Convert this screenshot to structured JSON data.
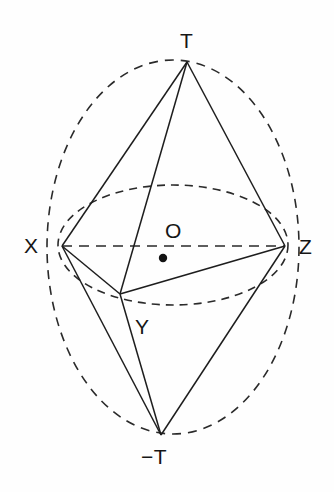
{
  "figure": {
    "canvas": {
      "width": 334,
      "height": 492
    },
    "background_color": "#fefefe",
    "stroke_color": "#1d1d1d",
    "dash_color": "#2a2a2a"
  },
  "labels": {
    "apex_top": "T",
    "apex_bottom": "−T",
    "left": "X",
    "right": "Z",
    "front": "Y",
    "center": "O"
  },
  "points": {
    "T": {
      "name": "T",
      "x": 187,
      "y": 62,
      "label_x": 180,
      "label_y": 30
    },
    "X": {
      "name": "X",
      "x": 62,
      "y": 246,
      "label_x": 24,
      "label_y": 235
    },
    "Z": {
      "name": "Z",
      "x": 285,
      "y": 246,
      "label_x": 299,
      "label_y": 236
    },
    "Y": {
      "name": "Y",
      "x": 120,
      "y": 294,
      "label_x": 135,
      "label_y": 316
    },
    "NT": {
      "name": "-T",
      "x": 161,
      "y": 435,
      "label_x": 141,
      "label_y": 446
    },
    "O": {
      "name": "O",
      "x": 163,
      "y": 258,
      "label_x": 165,
      "label_y": 220
    }
  },
  "center_dot": {
    "x": 163,
    "y": 258,
    "r": 4.2
  },
  "outer_ellipse": {
    "cx": 173,
    "cy": 247,
    "rx": 126,
    "ry": 187,
    "style": "dashed"
  },
  "inner_ellipse": {
    "cx": 173,
    "cy": 245,
    "rx": 115,
    "ry": 60,
    "style": "dashed"
  },
  "solid_edges": [
    {
      "id": "T-X",
      "from": "T",
      "to": "X"
    },
    {
      "id": "T-Y",
      "from": "T",
      "to": "Y"
    },
    {
      "id": "T-Z",
      "from": "T",
      "to": "Z"
    },
    {
      "id": "X-Y",
      "from": "X",
      "to": "Y"
    },
    {
      "id": "Y-Z",
      "from": "Y",
      "to": "Z"
    },
    {
      "id": "X-NT",
      "from": "X",
      "to": "NT"
    },
    {
      "id": "Y-NT",
      "from": "Y",
      "to": "NT"
    },
    {
      "id": "Z-NT",
      "from": "Z",
      "to": "NT"
    }
  ],
  "dashed_edges": [
    {
      "id": "X-Z",
      "from": "X",
      "to": "Z"
    }
  ],
  "stroke_widths": {
    "edge": 1.5,
    "ellipse": 1.6,
    "dash_edge": 1.6
  },
  "dash_patterns": {
    "outer": "9 7",
    "inner": "8 6",
    "axis": "10 7"
  }
}
